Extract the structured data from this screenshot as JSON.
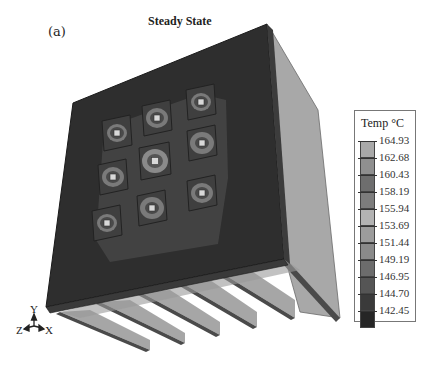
{
  "figure": {
    "panel_label": "(a)",
    "title": "Steady State"
  },
  "legend": {
    "title": "Temp °C",
    "entries": [
      {
        "value": "164.93",
        "color": "#a9a9a9"
      },
      {
        "value": "162.68",
        "color": "#8f8f8f"
      },
      {
        "value": "160.43",
        "color": "#6e6e6e"
      },
      {
        "value": "158.19",
        "color": "#7d7d7d"
      },
      {
        "value": "155.94",
        "color": "#b3b3b3"
      },
      {
        "value": "153.69",
        "color": "#9c9c9c"
      },
      {
        "value": "151.44",
        "color": "#8a8a8a"
      },
      {
        "value": "149.19",
        "color": "#6c6c6c"
      },
      {
        "value": "146.95",
        "color": "#555555"
      },
      {
        "value": "144.70",
        "color": "#3a3a3a"
      },
      {
        "value": "142.45",
        "color": "#262626"
      }
    ]
  },
  "axes_triad": {
    "y_label": "Y",
    "z_label": "Z",
    "x_label": "X"
  },
  "model": {
    "description": "Heat sink with 3x3 chip array on base plate and vertical fins",
    "chip_grid": {
      "rows": 3,
      "cols": 3
    },
    "fin_count": 6,
    "colors": {
      "plate": "#2e2e2e",
      "plate_edge": "#1c1c1c",
      "fin_face": "#a6a6a6",
      "fin_edge": "#4a4a4a",
      "chip_pad": "#3f3f3f",
      "chip_ring": "#7a7a7a",
      "chip_center": "#d8d8d8"
    }
  }
}
